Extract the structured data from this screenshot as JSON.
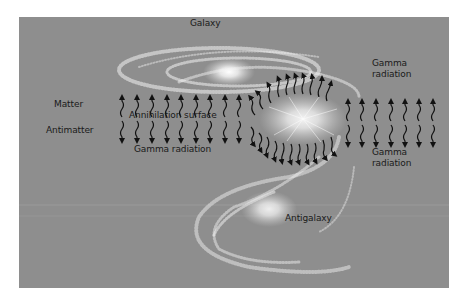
{
  "figure": {
    "background_color": "#8e8e8e",
    "labels": {
      "galaxy": "Galaxy",
      "antigalaxy": "Antigalaxy",
      "matter": "Matter",
      "antimatter": "Antimatter",
      "annihilation_surface": "Annihilation surface",
      "gamma_radiation_bottom": "Gamma radiation",
      "gamma_right_top_line1": "Gamma",
      "gamma_right_top_line2": "radiation",
      "gamma_right_bottom_line1": "Gamma",
      "gamma_right_bottom_line2": "radiation"
    },
    "arrow_rows": {
      "up_count_left": 9,
      "up_count_right": 7,
      "down_count_left": 9,
      "down_count_right": 7
    }
  }
}
